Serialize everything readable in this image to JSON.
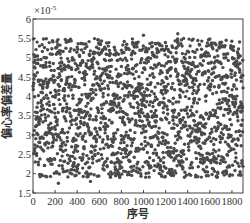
{
  "chart_data": {
    "type": "scatter",
    "title": "",
    "xlabel": "序号",
    "ylabel": "偏心率偏差量",
    "y_multiplier": "×10^-5",
    "y_multiplier_label": "×10",
    "y_multiplier_exp": "-5",
    "xlim": [
      0,
      1900
    ],
    "ylim": [
      1.5,
      6
    ],
    "xticks": [
      0,
      200,
      400,
      600,
      800,
      1000,
      1200,
      1400,
      1600,
      1800
    ],
    "yticks": [
      1.5,
      2,
      2.5,
      3,
      3.5,
      4,
      4.5,
      5,
      5.5,
      6
    ],
    "ytick_labels": [
      "1.5",
      "2",
      "2.5",
      "3",
      "3.5",
      "4",
      "4.5",
      "5",
      "5.5",
      "6"
    ],
    "grid": false,
    "legend": null,
    "series": [
      {
        "name": "偏心率偏差量",
        "n_points": 1900,
        "x_range": [
          1,
          1900
        ],
        "y_distribution": "uniform",
        "y_range": [
          1.9,
          5.5
        ],
        "outliers": [
          {
            "x": 230,
            "y": 1.75
          },
          {
            "x": 520,
            "y": 1.8
          },
          {
            "x": 1310,
            "y": 5.62
          },
          {
            "x": 1000,
            "y": 5.58
          }
        ],
        "marker": "circle",
        "color": "#4a4a4a"
      }
    ]
  }
}
